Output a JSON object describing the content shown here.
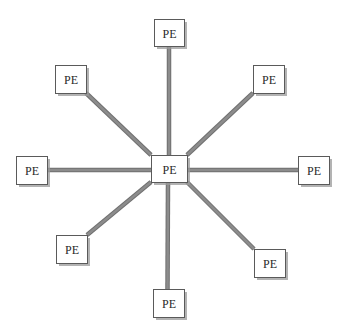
{
  "diagram": {
    "type": "star-topology",
    "center": {
      "id": "pe-center",
      "label": "PE"
    },
    "nodes": [
      {
        "id": "pe-top",
        "label": "PE",
        "direction": "north"
      },
      {
        "id": "pe-top-right",
        "label": "PE",
        "direction": "north-east"
      },
      {
        "id": "pe-right",
        "label": "PE",
        "direction": "east"
      },
      {
        "id": "pe-bottom-right",
        "label": "PE",
        "direction": "south-east"
      },
      {
        "id": "pe-bottom",
        "label": "PE",
        "direction": "south"
      },
      {
        "id": "pe-bottom-left",
        "label": "PE",
        "direction": "south-west"
      },
      {
        "id": "pe-left",
        "label": "PE",
        "direction": "west"
      },
      {
        "id": "pe-top-left",
        "label": "PE",
        "direction": "north-west"
      }
    ],
    "edges": [
      {
        "from": "pe-center",
        "to": "pe-top"
      },
      {
        "from": "pe-center",
        "to": "pe-top-right"
      },
      {
        "from": "pe-center",
        "to": "pe-right"
      },
      {
        "from": "pe-center",
        "to": "pe-bottom-right"
      },
      {
        "from": "pe-center",
        "to": "pe-bottom"
      },
      {
        "from": "pe-center",
        "to": "pe-bottom-left"
      },
      {
        "from": "pe-center",
        "to": "pe-left"
      },
      {
        "from": "pe-center",
        "to": "pe-top-left"
      }
    ],
    "colors": {
      "link": "#8c8c8c",
      "link_edge": "#6f6f6f",
      "box_fill": "#ffffff",
      "box_border": "#5a5a5a",
      "shadow": "#9a9a9a",
      "text": "#2a2a2a"
    }
  }
}
